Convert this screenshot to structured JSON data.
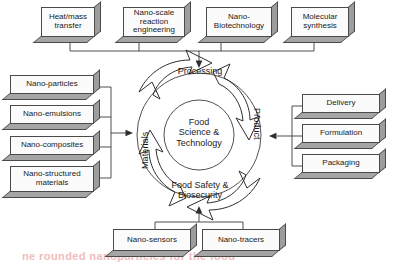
{
  "figure": {
    "center_label_lines": [
      "Food",
      "Science &",
      "Technology"
    ],
    "cycle_stages": [
      {
        "id": "processing",
        "label": "Processing"
      },
      {
        "id": "product",
        "label": "Product"
      },
      {
        "id": "food-safety",
        "label_lines": [
          "Food Safety &",
          "Biosecurity"
        ]
      },
      {
        "id": "materials",
        "label": "Materials"
      }
    ]
  },
  "groups": {
    "top": {
      "name": "processing-inputs",
      "items": [
        {
          "id": "heat-mass-transfer",
          "lines": [
            "Heat/mass",
            "transfer"
          ]
        },
        {
          "id": "nano-scale-reaction-engineering",
          "lines": [
            "Nano-scale",
            "reaction",
            "engineering"
          ]
        },
        {
          "id": "nano-biotechnology",
          "lines": [
            "Nano-",
            "Biotechnology"
          ]
        },
        {
          "id": "molecular-synthesis",
          "lines": [
            "Molecular",
            "synthesis"
          ]
        }
      ]
    },
    "left": {
      "name": "materials-inputs",
      "items": [
        {
          "id": "nano-particles",
          "lines": [
            "Nano-particles"
          ]
        },
        {
          "id": "nano-emulsions",
          "lines": [
            "Nano-emulsions"
          ]
        },
        {
          "id": "nano-composites",
          "lines": [
            "Nano-composites"
          ]
        },
        {
          "id": "nano-structured-materials",
          "lines": [
            "Nano-structured",
            "materials"
          ]
        }
      ]
    },
    "right": {
      "name": "product-outputs",
      "items": [
        {
          "id": "delivery",
          "lines": [
            "Delivery"
          ]
        },
        {
          "id": "formulation",
          "lines": [
            "Formulation"
          ]
        },
        {
          "id": "packaging",
          "lines": [
            "Packaging"
          ]
        }
      ]
    },
    "bottom": {
      "name": "food-safety-inputs",
      "items": [
        {
          "id": "nano-sensors",
          "lines": [
            "Nano-sensors"
          ]
        },
        {
          "id": "nano-tracers",
          "lines": [
            "Nano-tracers"
          ]
        }
      ]
    }
  },
  "colors": {
    "box_face": "#fbfbfb",
    "box_side": "#9d9d9d",
    "outline": "#4a4a4a",
    "text": "#1a1a1a",
    "background": "#ffffff",
    "bleed_through": "#f0bcbc"
  },
  "artifacts": {
    "bleed_text": "ne rounded nanoparticles for the food"
  }
}
